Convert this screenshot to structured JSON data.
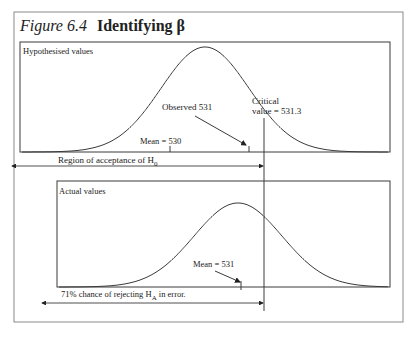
{
  "figure": {
    "label": "Figure 6.4",
    "title": "Identifying β"
  },
  "upper_panel": {
    "heading": "Hypothesised values",
    "observed_label": "Observed 531",
    "critical_label_line1": "Critical",
    "critical_label_line2": "value = 531.3",
    "mean_label": "Mean = 530",
    "region_label_main": "Region of acceptance of H",
    "region_label_sub": "0"
  },
  "lower_panel": {
    "heading": "Actual values",
    "mean_label": "Mean = 531",
    "chance_label_main": "71% chance of rejecting H",
    "chance_label_sub": "A",
    "chance_label_tail": " in error."
  },
  "values": {
    "hypothesised_mean": 530,
    "actual_mean": 531,
    "observed": 531,
    "critical_value": 531.3,
    "beta_percent": 71
  },
  "colors": {
    "line": "#3a3a3a",
    "frame": "#8a8a8a",
    "text": "#222222"
  }
}
